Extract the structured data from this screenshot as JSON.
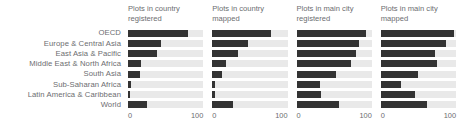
{
  "chart_data": {
    "type": "bar",
    "orientation": "horizontal",
    "layout": "small-multiples",
    "panels_per_row": 4,
    "title": "",
    "subtitle": "",
    "xlabel": "",
    "ylabel": "",
    "xlim": [
      0,
      100
    ],
    "xticks": [
      0,
      100
    ],
    "xtick_labels": [
      "0",
      "100"
    ],
    "grid": false,
    "legend": "none",
    "bar_color": "#333333",
    "track_color": "#e9e9e9",
    "categories": [
      "OECD",
      "Europe & Central Asia",
      "East Asia & Pacific",
      "Middle East & North Africa",
      "South Asia",
      "Sub-Saharan Africa",
      "Latin America & Caribbean",
      "World"
    ],
    "panels": [
      {
        "title": "Plots in country\nregistered",
        "title_line1": "Plots in country",
        "title_line2": "registered",
        "values": [
          80,
          44,
          39,
          17,
          16,
          4,
          3,
          25
        ]
      },
      {
        "title": "Plots in country\nmapped",
        "title_line1": "Plots in country",
        "title_line2": "mapped",
        "values": [
          78,
          47,
          34,
          18,
          13,
          4,
          4,
          28
        ]
      },
      {
        "title": "Plots in main city\nregistered",
        "title_line1": "Plots in main city",
        "title_line2": "registered",
        "values": [
          93,
          83,
          79,
          72,
          53,
          31,
          33,
          56
        ]
      },
      {
        "title": "Plots in main city\nmapped",
        "title_line1": "Plots in main city",
        "title_line2": "mapped",
        "values": [
          97,
          87,
          72,
          75,
          50,
          27,
          46,
          62
        ]
      }
    ]
  }
}
